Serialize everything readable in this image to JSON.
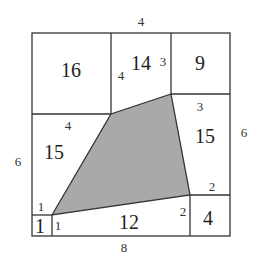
{
  "diagram": {
    "type": "geometry-area-puzzle",
    "colors": {
      "shaded": "#a9a9a9",
      "lines": "#333333",
      "background": "#ffffff"
    },
    "outer_labels": {
      "top": "4",
      "left": "6",
      "right": "6",
      "bottom": "8"
    },
    "regions": [
      {
        "id": "top-left",
        "area": "16"
      },
      {
        "id": "top-middle",
        "area": "14"
      },
      {
        "id": "top-right",
        "area": "9"
      },
      {
        "id": "left",
        "area": "15"
      },
      {
        "id": "right",
        "area": "15"
      },
      {
        "id": "bottom",
        "area": "12"
      },
      {
        "id": "bottom-right",
        "area": "4"
      },
      {
        "id": "bottom-left-small",
        "area": "1"
      }
    ],
    "edge_labels": {
      "top_middle_left": "4",
      "top_middle_right": "3",
      "right_top": "3",
      "left_top": "4",
      "right_bottom": "2",
      "bottom_right": "2",
      "small_top": "1",
      "small_right": "1"
    }
  }
}
